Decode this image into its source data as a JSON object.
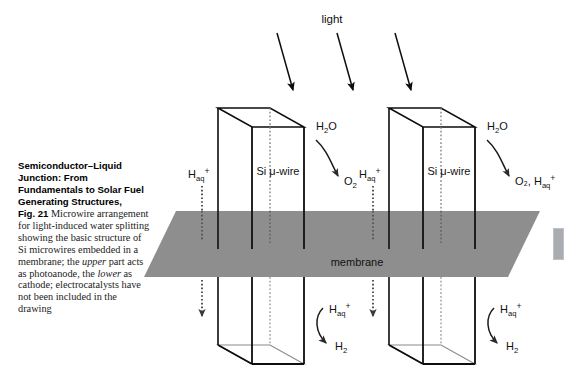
{
  "figure": {
    "caption": {
      "chapter_title": "Semiconductor–Liquid Junction: From Fundamentals to Solar Fuel Generating Structures,",
      "fig_number": "Fig. 21",
      "body_part_1": " Microwire arrangement for light-induced water splitting showing the basic structure of Si microwires embedded in a membrane; the ",
      "italic_1": "upper",
      "body_part_2": " part acts as photoanode, the ",
      "italic_2": "lower",
      "body_part_3": " as cathode; electrocatalysts have not been included in the drawing"
    },
    "labels": {
      "light": "light",
      "membrane": "membrane",
      "wire_left": "Si μ-wire",
      "wire_right": "Si μ-wire",
      "water_left": "H₂O",
      "water_right": "H₂O",
      "product_left": "O₂",
      "product_right": "O₂, H₂ₐ₊",
      "product_right_text": "O₂, H",
      "proton_sub": "aq",
      "proton_sup": "+",
      "proton_base": "H",
      "hydrogen_base": "H",
      "hydrogen_sub": "2",
      "oxygen_base": "O",
      "oxygen_sub": "2",
      "water_base": "H",
      "water_sub": "2",
      "water_tail": "O"
    },
    "colors": {
      "membrane_fill": "#8e8e8e",
      "stroke": "#0d0d0d",
      "back_edge": "#8a8a8a",
      "background": "#ffffff",
      "edge_tab": "#a9adb2"
    },
    "counts": {
      "light_arrows": 3,
      "microwires": 2
    }
  }
}
